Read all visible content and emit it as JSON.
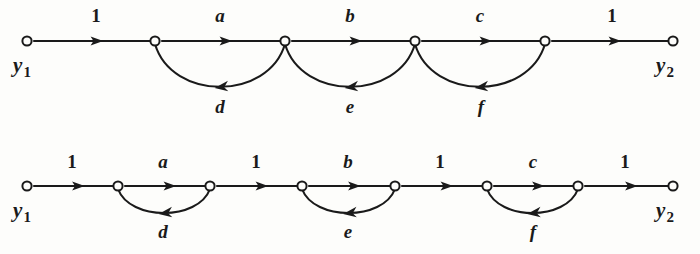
{
  "figure": {
    "type": "signal-flow-graph",
    "background_color": "#fdfdfb",
    "ink_color": "#1a1a1a",
    "graph_count": 2
  },
  "graphs": [
    {
      "id": "top-graph",
      "name": "signal-flow-graph-top",
      "baseline_y": 41,
      "node_count": 6,
      "nodes": [
        {
          "id": "t1",
          "x": 27,
          "label": "y",
          "sub": "1",
          "label_x": 22,
          "label_y": 72,
          "has_label": true
        },
        {
          "id": "t2",
          "x": 155,
          "label": "",
          "sub": "",
          "has_label": false
        },
        {
          "id": "t3",
          "x": 285,
          "label": "",
          "sub": "",
          "has_label": false
        },
        {
          "id": "t4",
          "x": 415,
          "label": "",
          "sub": "",
          "has_label": false
        },
        {
          "id": "t5",
          "x": 545,
          "label": "",
          "sub": "",
          "has_label": false
        },
        {
          "id": "t6",
          "x": 673,
          "label": "y",
          "sub": "2",
          "label_x": 665,
          "label_y": 72,
          "has_label": true
        }
      ],
      "forward_edges": [
        {
          "from": "t1",
          "to": "t2",
          "gain": "1",
          "italic": false,
          "x1": 34,
          "x2": 150,
          "label_x": 96,
          "label_y": 22
        },
        {
          "from": "t2",
          "to": "t3",
          "gain": "a",
          "italic": true,
          "x1": 162,
          "x2": 280,
          "label_x": 220,
          "label_y": 22
        },
        {
          "from": "t3",
          "to": "t4",
          "gain": "b",
          "italic": true,
          "x1": 292,
          "x2": 410,
          "label_x": 350,
          "label_y": 22
        },
        {
          "from": "t4",
          "to": "t5",
          "gain": "c",
          "italic": true,
          "x1": 422,
          "x2": 540,
          "label_x": 480,
          "label_y": 22
        },
        {
          "from": "t5",
          "to": "t6",
          "gain": "1",
          "italic": false,
          "x1": 552,
          "x2": 668,
          "label_x": 612,
          "label_y": 22
        }
      ],
      "feedback_edges": [
        {
          "from": "t3",
          "to": "t2",
          "gain": "d",
          "italic": true,
          "from_x": 285,
          "to_x": 155,
          "dip": 48,
          "label_x": 220,
          "label_y": 113
        },
        {
          "from": "t4",
          "to": "t3",
          "gain": "e",
          "italic": true,
          "from_x": 415,
          "to_x": 285,
          "dip": 48,
          "label_x": 350,
          "label_y": 113
        },
        {
          "from": "t5",
          "to": "t4",
          "gain": "f",
          "italic": true,
          "from_x": 545,
          "to_x": 415,
          "dip": 48,
          "label_x": 481,
          "label_y": 113
        }
      ]
    },
    {
      "id": "bottom-graph",
      "name": "signal-flow-graph-bottom",
      "baseline_y": 186,
      "node_count": 8,
      "nodes": [
        {
          "id": "b1",
          "x": 27,
          "label": "y",
          "sub": "1",
          "label_x": 22,
          "label_y": 217,
          "has_label": true
        },
        {
          "id": "b2",
          "x": 118,
          "label": "",
          "sub": "",
          "has_label": false
        },
        {
          "id": "b3",
          "x": 210,
          "label": "",
          "sub": "",
          "has_label": false
        },
        {
          "id": "b4",
          "x": 302,
          "label": "",
          "sub": "",
          "has_label": false
        },
        {
          "id": "b5",
          "x": 395,
          "label": "",
          "sub": "",
          "has_label": false
        },
        {
          "id": "b6",
          "x": 487,
          "label": "",
          "sub": "",
          "has_label": false
        },
        {
          "id": "b7",
          "x": 578,
          "label": "",
          "sub": "",
          "has_label": false
        },
        {
          "id": "b8",
          "x": 673,
          "label": "y",
          "sub": "2",
          "label_x": 665,
          "label_y": 217,
          "has_label": true
        }
      ],
      "forward_edges": [
        {
          "from": "b1",
          "to": "b2",
          "gain": "1",
          "italic": false,
          "x1": 34,
          "x2": 113,
          "label_x": 72,
          "label_y": 168
        },
        {
          "from": "b2",
          "to": "b3",
          "gain": "a",
          "italic": true,
          "x1": 125,
          "x2": 205,
          "label_x": 163,
          "label_y": 168
        },
        {
          "from": "b3",
          "to": "b4",
          "gain": "1",
          "italic": false,
          "x1": 217,
          "x2": 297,
          "label_x": 256,
          "label_y": 168
        },
        {
          "from": "b4",
          "to": "b5",
          "gain": "b",
          "italic": true,
          "x1": 309,
          "x2": 390,
          "label_x": 348,
          "label_y": 168
        },
        {
          "from": "b5",
          "to": "b6",
          "gain": "1",
          "italic": false,
          "x1": 402,
          "x2": 482,
          "label_x": 440,
          "label_y": 168
        },
        {
          "from": "b6",
          "to": "b7",
          "gain": "c",
          "italic": true,
          "x1": 494,
          "x2": 573,
          "label_x": 533,
          "label_y": 168
        },
        {
          "from": "b7",
          "to": "b8",
          "gain": "1",
          "italic": false,
          "x1": 585,
          "x2": 668,
          "label_x": 625,
          "label_y": 168
        }
      ],
      "feedback_edges": [
        {
          "from": "b3",
          "to": "b2",
          "gain": "d",
          "italic": true,
          "from_x": 210,
          "to_x": 118,
          "dip": 28,
          "label_x": 163,
          "label_y": 238
        },
        {
          "from": "b5",
          "to": "b4",
          "gain": "e",
          "italic": true,
          "from_x": 395,
          "to_x": 302,
          "dip": 28,
          "label_x": 348,
          "label_y": 238
        },
        {
          "from": "b7",
          "to": "b6",
          "gain": "f",
          "italic": true,
          "from_x": 578,
          "to_x": 487,
          "dip": 28,
          "label_x": 533,
          "label_y": 238
        }
      ]
    }
  ],
  "chart_data": {
    "type": "diagram",
    "title": "",
    "graphs": [
      {
        "name": "top",
        "nodes": [
          "y1",
          "n2",
          "n3",
          "n4",
          "n5",
          "y2"
        ],
        "forward_branch_gains": [
          "1",
          "a",
          "b",
          "c",
          "1"
        ],
        "feedback_branch_gains": [
          "d",
          "e",
          "f"
        ],
        "feedback_spans": [
          [
            "n3",
            "n2"
          ],
          [
            "n4",
            "n3"
          ],
          [
            "n5",
            "n4"
          ]
        ]
      },
      {
        "name": "bottom",
        "nodes": [
          "y1",
          "n2",
          "n3",
          "n4",
          "n5",
          "n6",
          "n7",
          "y2"
        ],
        "forward_branch_gains": [
          "1",
          "a",
          "1",
          "b",
          "1",
          "c",
          "1"
        ],
        "feedback_branch_gains": [
          "d",
          "e",
          "f"
        ],
        "feedback_spans": [
          [
            "n3",
            "n2"
          ],
          [
            "n5",
            "n4"
          ],
          [
            "n7",
            "n6"
          ]
        ]
      }
    ]
  }
}
